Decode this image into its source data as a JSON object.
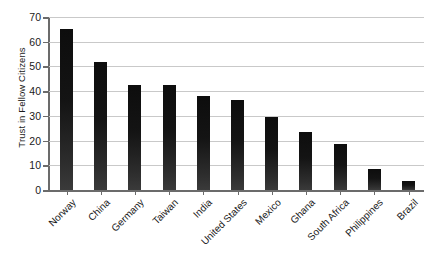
{
  "chart_data": {
    "type": "bar",
    "title": "",
    "xlabel": "",
    "ylabel": "Trust in Fellow Citizens",
    "ylim": [
      0,
      70
    ],
    "ytick_step": 10,
    "yticks": [
      "0",
      "10",
      "20",
      "30",
      "40",
      "50",
      "60",
      "70"
    ],
    "grid": true,
    "legend": false,
    "bar_color": "#141414",
    "gridline_color": "#c9c9c9",
    "axis_color": "#6b6b6b",
    "categories": [
      "Norway",
      "China",
      "Germany",
      "Taiwan",
      "India",
      "United States",
      "Mexico",
      "Ghana",
      "South Africa",
      "Philippines",
      "Brazil"
    ],
    "values": [
      65,
      52,
      42.5,
      42.5,
      38,
      36.5,
      29.5,
      23.5,
      18.5,
      8.5,
      3.5
    ]
  }
}
